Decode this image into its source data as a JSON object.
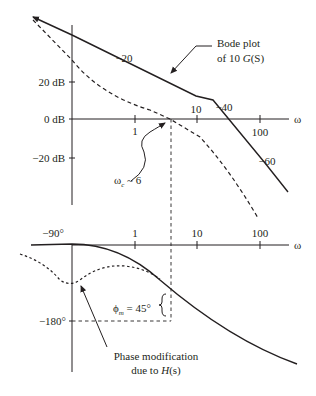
{
  "magnitude_plot": {
    "y_axis_ticks": [
      {
        "label": "20 dB",
        "value": 20
      },
      {
        "label": "0 dB",
        "value": 0
      },
      {
        "label": "−20 dB",
        "value": -20
      }
    ],
    "x_axis_ticks": [
      {
        "label": "1",
        "value": 1
      },
      {
        "label": "10",
        "value": 10
      },
      {
        "label": "100",
        "value": 100
      }
    ],
    "x_axis_label": "ω",
    "slope_labels": [
      "−20",
      "−40",
      "−60"
    ],
    "annotation_bode": {
      "line1": "Bode plot",
      "line2_prefix": "of 10 ",
      "line2_func": "G",
      "line2_arg": "(S)"
    },
    "annotation_crossover": {
      "symbol": "ω",
      "subscript": "c",
      "suffix": " ~ 6"
    }
  },
  "phase_plot": {
    "y_axis_ticks": [
      {
        "label": "−90°",
        "value": -90
      },
      {
        "label": "−180°",
        "value": -180
      }
    ],
    "x_axis_ticks": [
      {
        "label": "1",
        "value": 1
      },
      {
        "label": "10",
        "value": 10
      },
      {
        "label": "100",
        "value": 100
      }
    ],
    "x_axis_label": "ω",
    "annotation_margin": {
      "symbol": "ϕ",
      "subscript": "m",
      "suffix": " = 45°"
    },
    "annotation_modification": {
      "line1": "Phase modification",
      "line2_prefix": "due to ",
      "line2_func": "H",
      "line2_arg": "(s)"
    }
  },
  "colors": {
    "ink": "#231f20",
    "background": "#ffffff"
  }
}
